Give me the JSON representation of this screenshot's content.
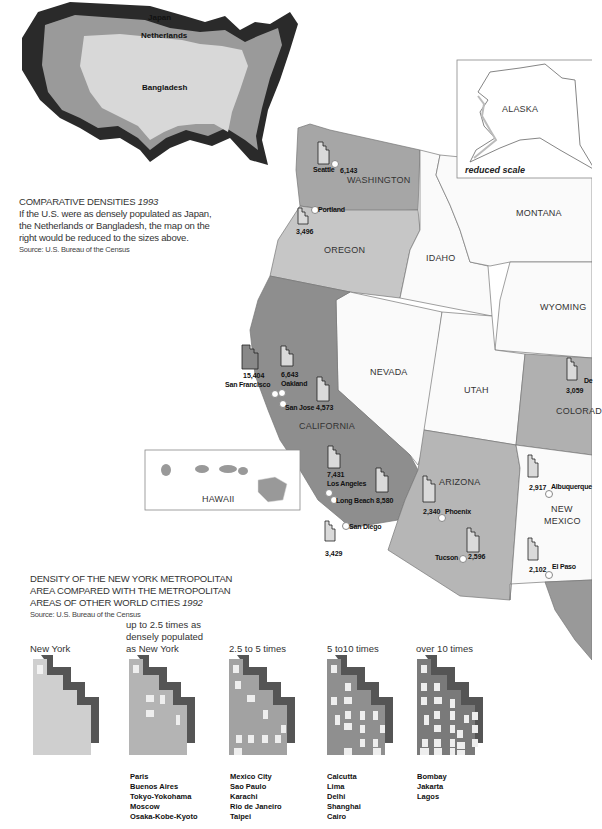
{
  "inset_us": {
    "labels": {
      "japan": "Japan",
      "netherlands": "Netherlands",
      "bangladesh": "Bangladesh"
    },
    "colors": {
      "japan": "#2a2a2a",
      "netherlands": "#9a9a9a",
      "bangladesh": "#d8d8d8"
    }
  },
  "comparative": {
    "title": "COMPARATIVE DENSITIES",
    "year": "1993",
    "body": [
      "If the U.S. were as densely populated as Japan,",
      "the Netherlands or Bangladesh, the map on the",
      "right would be reduced to the sizes above."
    ],
    "source": "Source: U.S. Bureau of the Census"
  },
  "alaska": {
    "label": "ALASKA",
    "note": "reduced scale"
  },
  "hawaii": {
    "label": "HAWAII"
  },
  "states": {
    "washington": "WASHINGTON",
    "oregon": "OREGON",
    "idaho": "IDAHO",
    "montana": "MONTANA",
    "wyoming": "WYOMING",
    "nevada": "NEVADA",
    "utah": "UTAH",
    "colorado": "COLORAD",
    "california": "CALIFORNIA",
    "arizona": "ARIZONA",
    "new_mexico_1": "NEW",
    "new_mexico_2": "MEXICO"
  },
  "cities": [
    {
      "name": "Seattle",
      "value": "6,143"
    },
    {
      "name": "Portland",
      "value": "3,496"
    },
    {
      "name": "San Francisco",
      "value": "15,404"
    },
    {
      "name": "Oakland",
      "value": "6,643"
    },
    {
      "name": "San Jose",
      "value": "4,573"
    },
    {
      "name": "Los Angeles",
      "value": "7,431"
    },
    {
      "name": "Long Beach",
      "value": "8,580"
    },
    {
      "name": "San Diego",
      "value": "3,429"
    },
    {
      "name": "Phoenix",
      "value": "2,340"
    },
    {
      "name": "Tucson",
      "value": "2,596"
    },
    {
      "name": "Albuquerque",
      "value": "2,917"
    },
    {
      "name": "El Paso",
      "value": "2,102"
    },
    {
      "name": "De",
      "value": "3,059"
    }
  ],
  "nyc": {
    "title": [
      "DENSITY OF THE NEW YORK METROPOLITAN",
      "AREA COMPARED WITH THE METROPOLITAN"
    ],
    "title_last": "AREAS OF OTHER WORLD CITIES",
    "year": "1992",
    "source": "Source: U.S. Bureau of the Census",
    "categories": [
      {
        "label": [
          "New York"
        ],
        "cities": []
      },
      {
        "label": [
          "up to 2.5  times as",
          "densely populated",
          "as New York"
        ],
        "cities": [
          "Paris",
          "Buenos Aires",
          "Tokyo-Yokohama",
          "Moscow",
          "Osaka-Kobe-Kyoto"
        ]
      },
      {
        "label": [
          "2.5 to 5 times"
        ],
        "cities": [
          "Mexico City",
          "Sao Paulo",
          "Karachi",
          "Rio de Janeiro",
          "Taipei"
        ]
      },
      {
        "label": [
          "5 to10 times"
        ],
        "cities": [
          "Calcutta",
          "Lima",
          "Delhi",
          "Shanghai",
          "Cairo"
        ]
      },
      {
        "label": [
          "over 10 times"
        ],
        "cities": [
          "Bombay",
          "Jakarta",
          "Lagos"
        ]
      }
    ],
    "colors": [
      "#cfcfcf",
      "#b4b4b4",
      "#a2a2a2",
      "#8f8f8f",
      "#7a7a7a"
    ]
  }
}
